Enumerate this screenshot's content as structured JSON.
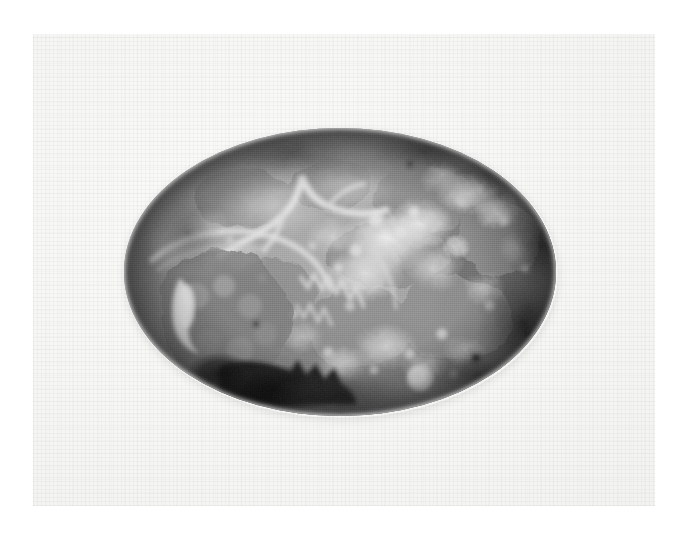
{
  "page": {
    "width": 688,
    "height": 544,
    "page_background_color": "#ffffff",
    "paper_color": "#f6f6f5",
    "paper_texture": "fine woven grid / laid paper weave",
    "caption": "",
    "plate_number": ""
  },
  "figure": {
    "title": "",
    "medium": "black-and-white photographic halftone print",
    "mask_shape": "ellipse",
    "ellipse": {
      "center_x": 340,
      "center_y": 272,
      "radius_x": 216,
      "radius_y": 144
    },
    "tonal_range": {
      "darkest": "#1a1a1a",
      "midtone": "#8a8a88",
      "lightest": "#ececea"
    },
    "features": [
      {
        "name": "pale-branching-vessel",
        "description": "pale Y-shaped branching vessel or septum in the upper-left quadrant",
        "x": 250,
        "y": 200
      },
      {
        "name": "left-lobe-mass",
        "description": "coarse knobbly lobe with fissured margin at the left",
        "x": 200,
        "y": 300
      },
      {
        "name": "bright-cleft",
        "description": "bright white cleft or cut surface within the left lobe",
        "x": 180,
        "y": 290
      },
      {
        "name": "dark-recess",
        "description": "deep black shadowed recess with jagged edge at lower left",
        "x": 255,
        "y": 370
      },
      {
        "name": "serrated-ridge",
        "description": "serrated comb-like ridge of pale tissue running down-right of centre",
        "x": 295,
        "y": 295
      },
      {
        "name": "nodular-field",
        "description": "cloud-like field of pale raised nodules across the centre and right",
        "x": 400,
        "y": 250
      },
      {
        "name": "round-nodule",
        "description": "distinct round pale nodule near the lower edge",
        "x": 420,
        "y": 378
      },
      {
        "name": "edge-vignette",
        "description": "darkened vignette toward the right and upper margins of the oval",
        "x": 520,
        "y": 230
      }
    ]
  },
  "colors": {
    "page_white": "#ffffff",
    "paper": "#f6f6f5",
    "paper_shade": "#eeeeed",
    "photo_dark": "#1a1a1a",
    "photo_mid": "#8a8a88",
    "photo_light": "#ececea"
  }
}
